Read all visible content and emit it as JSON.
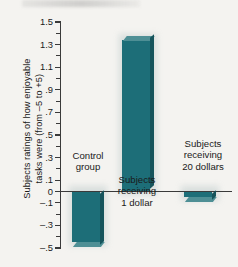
{
  "chart_data": {
    "type": "bar",
    "title": "",
    "xlabel": "",
    "ylabel": "Subjects ratings of how enjoyable tasks were (from –5 to +5)",
    "ylabel_lines": [
      "Subjects ratings of how enjoyable",
      "tasks were (from –5 to +5)"
    ],
    "categories": [
      "Control group",
      "Subjects receiving 1 dollar",
      "Subjects receiving 20 dollars"
    ],
    "category_label_lines": [
      [
        "Control",
        "group"
      ],
      [
        "Subjects",
        "receiving",
        "1 dollar"
      ],
      [
        "Subjects",
        "receiving",
        "20 dollars"
      ]
    ],
    "values": [
      -0.45,
      1.34,
      -0.05
    ],
    "ylim": [
      -0.5,
      1.5
    ],
    "ytick_values": [
      1.5,
      1.3,
      1.1,
      0.9,
      0.7,
      0.5,
      0.3,
      0.1,
      0,
      -0.1,
      -0.3,
      -0.5
    ],
    "ytick_labels": [
      "1.5",
      "1.3",
      "1.1",
      ".9",
      ".7",
      ".5",
      ".3",
      ".1",
      "0",
      "–.1",
      "–.3",
      "–.5"
    ],
    "yminor_values": [
      1.4,
      1.2,
      1.0,
      0.8,
      0.6,
      0.4,
      0.2,
      -0.2,
      -0.4
    ],
    "grid": false,
    "legend": false,
    "legend_position": "none",
    "zero_line": true,
    "bar_color": "#1d6e78",
    "bar_top_color": "#4e8f95",
    "bar_side_color": "#16545c",
    "axis_color": "#3a3a3a",
    "background_color": "#f4f3f0"
  }
}
